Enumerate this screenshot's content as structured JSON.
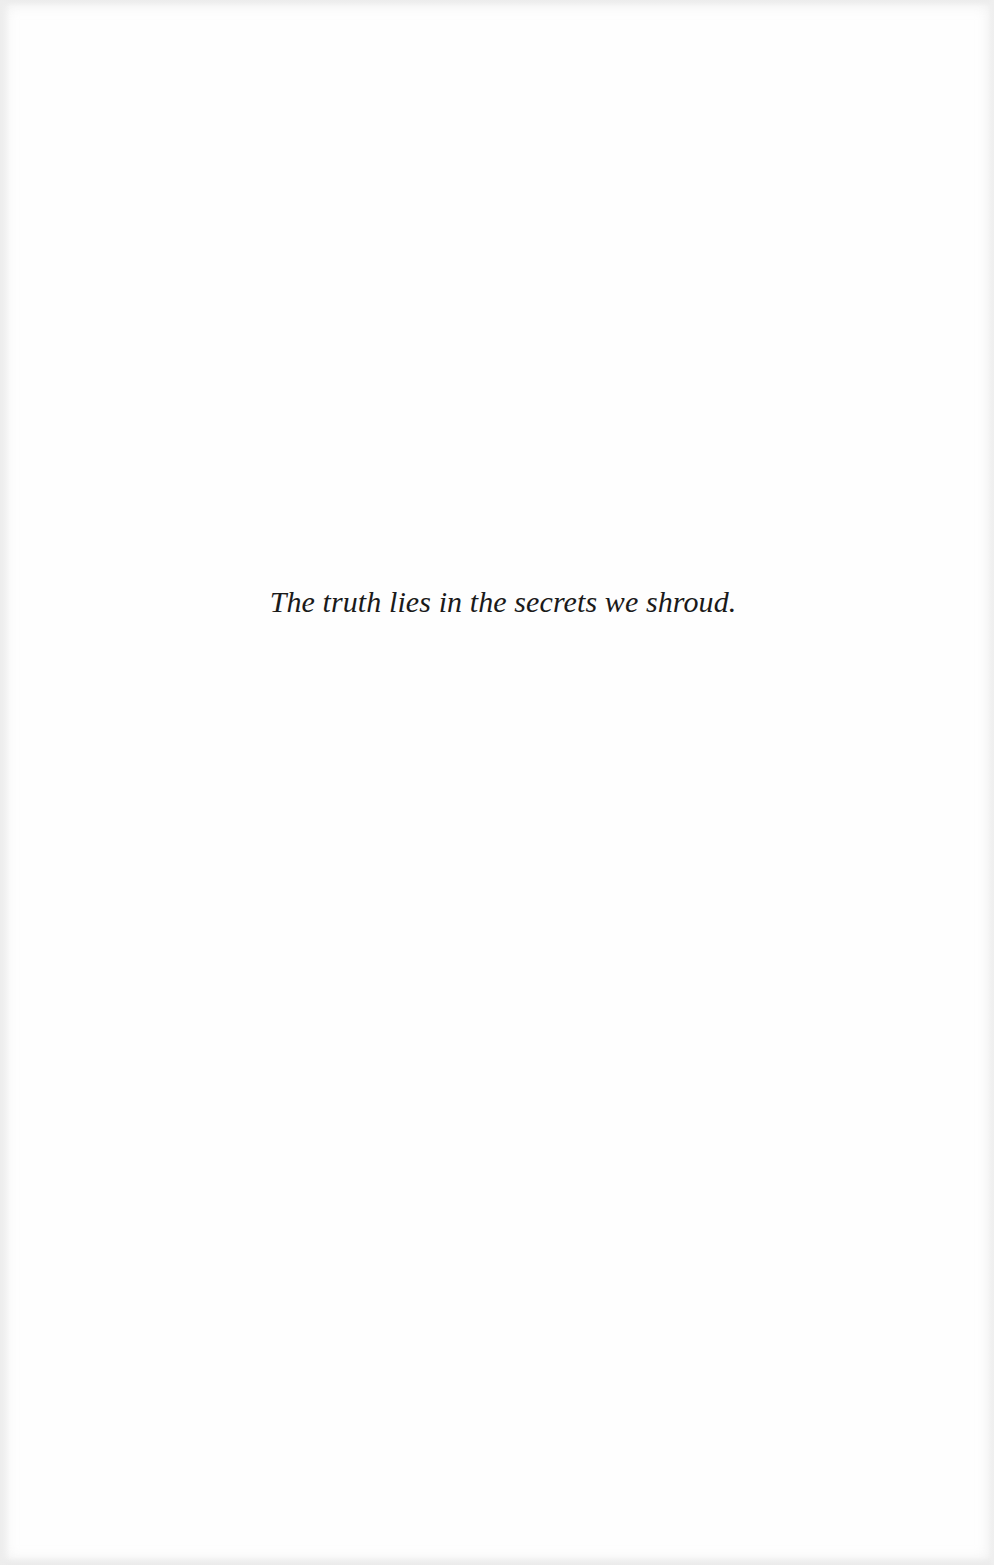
{
  "page": {
    "type": "epigraph",
    "epigraph_text": "The truth lies in the secrets we shroud.",
    "colors": {
      "background": "#fefefe",
      "text": "#1a1a1a"
    }
  }
}
